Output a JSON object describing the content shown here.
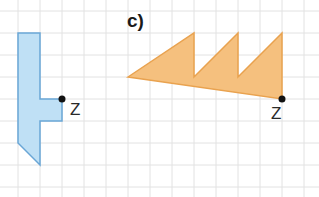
{
  "grid": {
    "spacing": 22,
    "offset_x": 18,
    "offset_y": 11,
    "color": "#e2e2e2"
  },
  "figures": [
    {
      "id": "blue-shape",
      "fill": "#bfe0f5",
      "stroke": "#6aa6d6",
      "points": "18,33 40,33 40,99 62,99 62,121 40,121 40,165 18,143",
      "center_label": "Z",
      "center_point": [
        62,
        99
      ],
      "label_pos": [
        70,
        115
      ]
    },
    {
      "id": "orange-shape",
      "part_label": "c)",
      "part_label_pos": [
        127,
        27
      ],
      "fill": "#f5c07e",
      "stroke": "#e9a24f",
      "points": "128,77 194,33 194,77 238,33 238,77 282,33 282,99",
      "center_label": "Z",
      "center_point": [
        282,
        99
      ],
      "label_pos": [
        271,
        119
      ]
    }
  ]
}
